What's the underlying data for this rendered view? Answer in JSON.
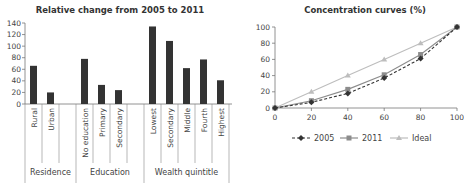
{
  "chart_data": [
    {
      "type": "bar",
      "title": "Relative change from 2005 to 2011",
      "xlabel": "",
      "ylabel": "",
      "ylim": [
        0,
        140
      ],
      "yticks": [
        0,
        20,
        40,
        60,
        80,
        100,
        120,
        140
      ],
      "groups": [
        {
          "name": "Residence",
          "categories": [
            "Rural",
            "Urban"
          ],
          "values": [
            66,
            20
          ]
        },
        {
          "name": "Education",
          "categories": [
            "No education",
            "Primary",
            "Secondary"
          ],
          "values": [
            78,
            33,
            24
          ]
        },
        {
          "name": "Wealth quintitle",
          "categories": [
            "Lowest",
            "Secondary",
            "Middle",
            "Fourth",
            "Highest"
          ],
          "values": [
            134,
            109,
            62,
            77,
            41
          ]
        }
      ],
      "categories": [
        "Rural",
        "Urban",
        "No education",
        "Primary",
        "Secondary",
        "Lowest",
        "Secondary",
        "Middle",
        "Fourth",
        "Highest"
      ],
      "values": [
        66,
        20,
        78,
        33,
        24,
        134,
        109,
        62,
        77,
        41
      ],
      "bar_color": "#333333",
      "grid": false
    },
    {
      "type": "line",
      "title": "Concentration curves (%)",
      "x": [
        0,
        20,
        40,
        60,
        80,
        100
      ],
      "xlim": [
        0,
        100
      ],
      "ylim": [
        0,
        100
      ],
      "xticks": [
        0,
        20,
        40,
        60,
        80,
        100
      ],
      "yticks": [
        0,
        20,
        40,
        60,
        80,
        100
      ],
      "series": [
        {
          "name": "2005",
          "values": [
            0,
            7,
            18,
            37,
            61,
            100
          ],
          "color": "#333333",
          "marker": "diamond",
          "dash": true
        },
        {
          "name": "2011",
          "values": [
            0,
            9,
            23,
            41,
            66,
            100
          ],
          "color": "#8c8c8c",
          "marker": "square",
          "dash": false
        },
        {
          "name": "Ideal",
          "values": [
            0,
            20,
            40,
            60,
            80,
            100
          ],
          "color": "#bdbdbd",
          "marker": "triangle",
          "dash": false
        }
      ],
      "legend_position": "bottom",
      "grid": false
    }
  ]
}
